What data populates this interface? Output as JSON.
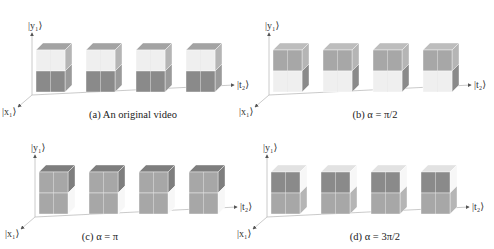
{
  "figure": {
    "colors": {
      "white_face": "#efefef",
      "white_side": "#f7f7f7",
      "white_top": "#e2e2e2",
      "dark_face": "#8a8a8a",
      "dark_side": "#9a9a9a",
      "dark_top": "#a3a3a3",
      "mid_face": "#a7a7a7",
      "mid_side": "#b5b5b5",
      "mid_top": "#bdbdbd",
      "grey_top_dark": "#7e7e7e",
      "axis": "#bdbdbd",
      "arrow": "#555555"
    },
    "axis_labels": {
      "y": "|y₁⟩",
      "x": "|x₁⟩",
      "t": "|t₂⟩"
    },
    "panels": [
      {
        "id": "a",
        "caption": "(a) An original video",
        "offset": [
          0,
          0
        ],
        "caption_pos": [
          133,
          118
        ],
        "scheme": "original"
      },
      {
        "id": "b",
        "caption": "(b)  α = π/2",
        "offset": [
          237,
          0
        ],
        "caption_pos": [
          375,
          118
        ],
        "scheme": "half_pi"
      },
      {
        "id": "c",
        "caption": "(c)   α = π",
        "offset": [
          3,
          122
        ],
        "caption_pos": [
          100,
          240
        ],
        "scheme": "pi"
      },
      {
        "id": "d",
        "caption": "(d) α = 3π/2",
        "offset": [
          235,
          122
        ],
        "caption_pos": [
          375,
          240
        ],
        "scheme": "three_half_pi"
      }
    ],
    "frames_per_panel": 4
  }
}
